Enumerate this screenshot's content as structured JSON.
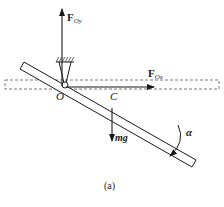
{
  "figure": {
    "caption": "(a)",
    "labels": {
      "force_vertical": {
        "main": "F",
        "sub": "Oy"
      },
      "force_horizontal": {
        "main": "F",
        "sub": "Ox"
      },
      "pivot": "O",
      "center_of_mass": "C",
      "weight": "mg",
      "angular_acceleration": "α"
    },
    "colors": {
      "ink": "#1a1a1a",
      "dashed": "#555555",
      "background": "#ffffff"
    }
  }
}
